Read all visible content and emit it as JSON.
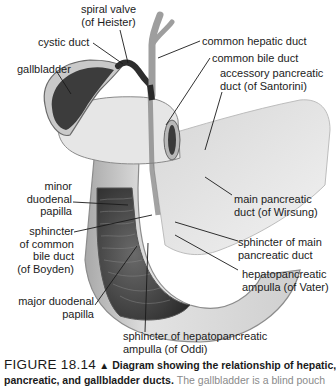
{
  "diagram": {
    "labels": {
      "spiral_valve": [
        "spiral valve",
        "(of Heister)"
      ],
      "cystic_duct": "cystic duct",
      "gallbladder": "gallbladder",
      "common_hepatic_duct": "common hepatic duct",
      "common_bile_duct": "common bile duct",
      "accessory_pancreatic_duct": [
        "accessory pancreatic",
        "duct (of Santorini)"
      ],
      "minor_duodenal_papilla": [
        "minor",
        "duodenal",
        "papilla"
      ],
      "sphincter_common_bile_duct": [
        "sphincter",
        "of common",
        "bile duct",
        "(of Boyden)"
      ],
      "main_pancreatic_duct": [
        "main pancreatic",
        "duct (of Wirsung)"
      ],
      "sphincter_main_pancreatic_duct": [
        "sphincter of main",
        "pancreatic duct"
      ],
      "hepatopancreatic_ampulla": [
        "hepatopancreatic",
        "ampulla (of Vater)"
      ],
      "major_duodenal_papilla": [
        "major duodenal",
        "papilla"
      ],
      "sphincter_hepatopancreatic_ampulla": [
        "sphincter of hepatopancreatic",
        "ampulla (of Oddi)"
      ]
    }
  },
  "caption": {
    "figure_number": "FIGURE 18.14",
    "marker": "▲",
    "title": "Diagram showing the relationship of hepatic,",
    "title_cont": "pancreatic, and gallbladder ducts.",
    "body": "The gallbladder is a blind pouch"
  }
}
